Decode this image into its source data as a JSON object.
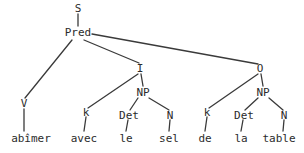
{
  "diagram": {
    "type": "syntax-tree",
    "title": "",
    "sentence": "abîmer avec le sel de la table",
    "line_color": "#3a3a3a",
    "text_color": "#2b2b2b",
    "background_color": "#ffffff",
    "nodes": {
      "s": "S",
      "pred": "Pred",
      "v": "V",
      "i": "I",
      "o": "O",
      "k1": "k",
      "np1": "NP",
      "det1": "Det",
      "n1": "N",
      "k2": "k",
      "np2": "NP",
      "det2": "Det",
      "n2": "N"
    },
    "words": {
      "w_abimer": "abîmer",
      "w_avec": "avec",
      "w_le": "le",
      "w_sel": "sel",
      "w_de": "de",
      "w_la": "la",
      "w_table": "table"
    }
  }
}
